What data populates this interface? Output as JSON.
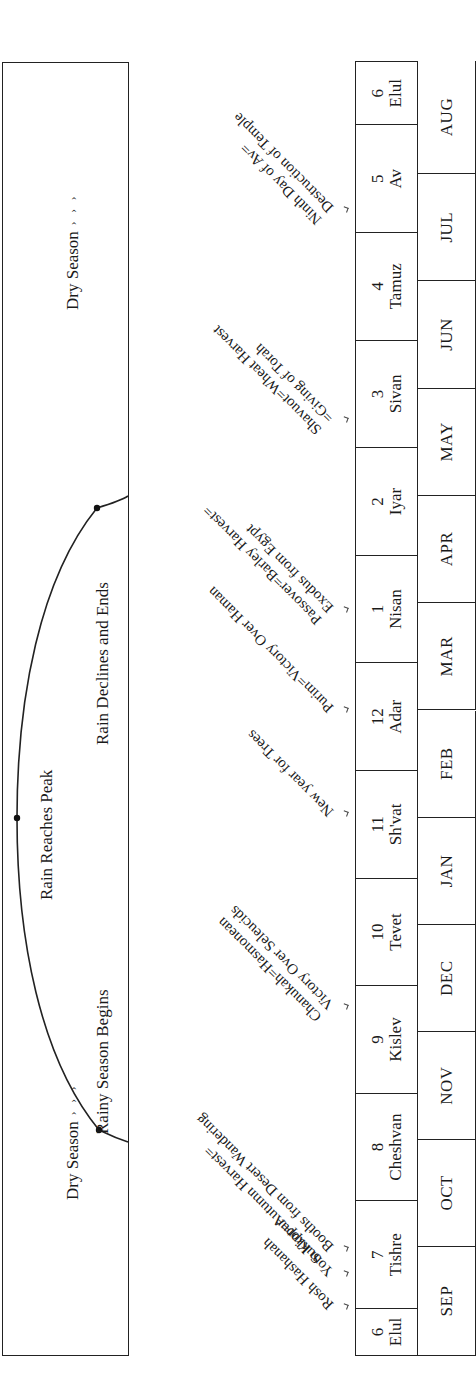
{
  "seasons": {
    "dry_start_label": "Dry Season",
    "dry_end_label": "Dry Season",
    "chevrons": "› › ›",
    "rainy_begins_label": "Rainy Season Begins",
    "rain_peak_label": "Rain Reaches Peak",
    "rain_declines_label": "Rain Declines and Ends"
  },
  "hebrew_months": [
    {
      "num": "6",
      "name": "Elul"
    },
    {
      "num": "7",
      "name": "Tishre"
    },
    {
      "num": "8",
      "name": "Cheshvan"
    },
    {
      "num": "9",
      "name": "Kislev"
    },
    {
      "num": "10",
      "name": "Tevet"
    },
    {
      "num": "11",
      "name": "Sh'vat"
    },
    {
      "num": "12",
      "name": "Adar"
    },
    {
      "num": "1",
      "name": "Nisan"
    },
    {
      "num": "2",
      "name": "Iyar"
    },
    {
      "num": "3",
      "name": "Sivan"
    },
    {
      "num": "4",
      "name": "Tamuz"
    },
    {
      "num": "5",
      "name": "Av"
    },
    {
      "num": "6",
      "name": "Elul"
    }
  ],
  "gregorian_months": [
    "SEP",
    "OCT",
    "NOV",
    "DEC",
    "JAN",
    "FEB",
    "MAR",
    "APR",
    "MAY",
    "JUN",
    "JUL",
    "AUG"
  ],
  "festivals": [
    {
      "lines": [
        "Rosh Hashanah"
      ]
    },
    {
      "lines": [
        "Yom Kippur"
      ]
    },
    {
      "lines": [
        "Sukkot=Autumn Harvest=",
        "Booths from Desert Wandering"
      ]
    },
    {
      "lines": [
        "Chanukah=Hasmonean",
        "Victory Over Seleucids"
      ]
    },
    {
      "lines": [
        "New year for Trees"
      ]
    },
    {
      "lines": [
        "Purim=Victory Over Haman"
      ]
    },
    {
      "lines": [
        "Passover=Barley Harvest=",
        "Exodus from Egypt"
      ]
    },
    {
      "lines": [
        "Shavuot=Wheat Harvest",
        "=Giving of Torah"
      ]
    },
    {
      "lines": [
        "Ninth Day of Av=",
        "Destruction of Temple"
      ]
    }
  ]
}
